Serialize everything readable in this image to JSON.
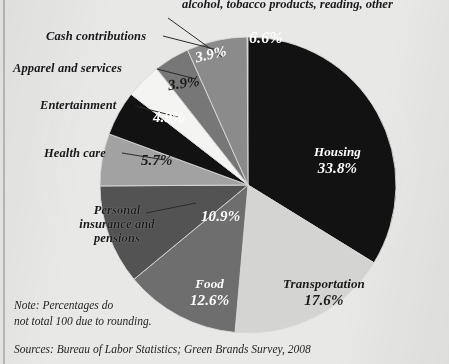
{
  "figure": {
    "background_color": "#e8e8e6",
    "note": "Note: Percentages do\nnot total 100 due to rounding.",
    "sources": "Sources: Bureau of Labor Statistics; Green Brands Survey, 2008"
  },
  "chart_data": {
    "type": "pie",
    "title": "",
    "legend_position": "callout-labels",
    "total_percent": 100,
    "start_angle_deg": 0,
    "direction": "clockwise",
    "categories": [
      "Housing",
      "Transportation",
      "Food",
      "Personal insurance and pensions",
      "Health care",
      "Entertainment",
      "Apparel and services",
      "Cash contributions",
      "alcohol, tobacco products, reading, other"
    ],
    "values": [
      33.8,
      17.6,
      12.6,
      10.9,
      5.7,
      4.9,
      3.9,
      3.9,
      6.6
    ],
    "slices": [
      {
        "name": "Housing",
        "label": "Housing",
        "percent_text": "33.8%",
        "value": 33.8,
        "color": "#121212",
        "label_placement": "inside",
        "text_color": "on-dark",
        "label_left": 314,
        "label_top": 130
      },
      {
        "name": "Transportation",
        "label": "Transportation",
        "percent_text": "17.6%",
        "value": 17.6,
        "color": "#d4d4d2",
        "label_placement": "inside",
        "text_color": "on-light",
        "label_left": 283,
        "label_top": 262
      },
      {
        "name": "Food",
        "label": "Food",
        "percent_text": "12.6%",
        "value": 12.6,
        "color": "#6e6e6e",
        "label_placement": "inside",
        "text_color": "on-dark",
        "label_left": 190,
        "label_top": 262
      },
      {
        "name": "Personal insurance and pensions",
        "label": "Personal\ninsurance and\npensions",
        "percent_text": "10.9%",
        "value": 10.9,
        "color": "#535353",
        "label_placement": "callout",
        "text_color": "on-dark",
        "callout_left": 62,
        "callout_top": 203,
        "pct_left": 201,
        "pct_top": 208
      },
      {
        "name": "Health care",
        "label": "Health care",
        "percent_text": "5.7%",
        "value": 5.7,
        "color": "#a2a2a2",
        "label_placement": "callout",
        "text_color": "on-light",
        "callout_left": 44,
        "callout_top": 146,
        "pct_left": 141,
        "pct_top": 152
      },
      {
        "name": "Entertainment",
        "label": "Entertainment",
        "percent_text": "4.9%",
        "value": 4.9,
        "color": "#121212",
        "label_placement": "callout",
        "text_color": "on-dark",
        "callout_left": 40,
        "callout_top": 98,
        "pct_left": 153,
        "pct_top": 109
      },
      {
        "name": "Apparel and services",
        "label": "Apparel and services",
        "percent_text": "3.9%",
        "value": 3.9,
        "color": "#f4f4f2",
        "label_placement": "callout",
        "text_color": "on-light",
        "callout_left": 13,
        "callout_top": 61,
        "pct_left": 168,
        "pct_top": 75
      },
      {
        "name": "Cash contributions",
        "label": "Cash contributions",
        "percent_text": "3.9%",
        "value": 3.9,
        "color": "#777777",
        "label_placement": "callout",
        "text_color": "on-dark",
        "callout_left": 46,
        "callout_top": 29,
        "pct_left": 195,
        "pct_top": 46
      },
      {
        "name": "alcohol-tobacco-reading-other",
        "label": "alcohol, tobacco products, reading, other",
        "percent_text": "6.6%",
        "value": 6.6,
        "color": "#8b8b8b",
        "label_placement": "callout-top",
        "text_color": "on-dark",
        "callout_left": 182,
        "callout_top": -3,
        "pct_left": 249,
        "pct_top": 29
      }
    ]
  }
}
